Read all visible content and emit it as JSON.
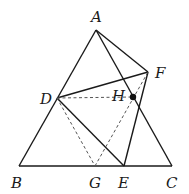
{
  "diagram": {
    "type": "geometry",
    "stroke_color": "#1a1a1a",
    "dash_color": "#555555",
    "points": {
      "A": {
        "label": "A",
        "x": 96,
        "y": 30
      },
      "B": {
        "label": "B",
        "x": 19,
        "y": 166
      },
      "C": {
        "label": "C",
        "x": 172,
        "y": 166
      },
      "D": {
        "label": "D",
        "x": 57,
        "y": 98
      },
      "E": {
        "label": "E",
        "x": 124,
        "y": 166
      },
      "F": {
        "label": "F",
        "x": 148,
        "y": 72
      },
      "G": {
        "label": "G",
        "x": 95,
        "y": 166
      },
      "H": {
        "label": "H",
        "x": 133,
        "y": 97
      }
    },
    "solid_segments": [
      [
        "A",
        "B"
      ],
      [
        "B",
        "C"
      ],
      [
        "A",
        "C"
      ],
      [
        "A",
        "F"
      ],
      [
        "D",
        "F"
      ],
      [
        "F",
        "E"
      ],
      [
        "D",
        "E"
      ]
    ],
    "dashed_segments": [
      [
        "D",
        "H"
      ],
      [
        "D",
        "G"
      ],
      [
        "G",
        "F"
      ]
    ],
    "dot_points": [
      "H"
    ]
  }
}
